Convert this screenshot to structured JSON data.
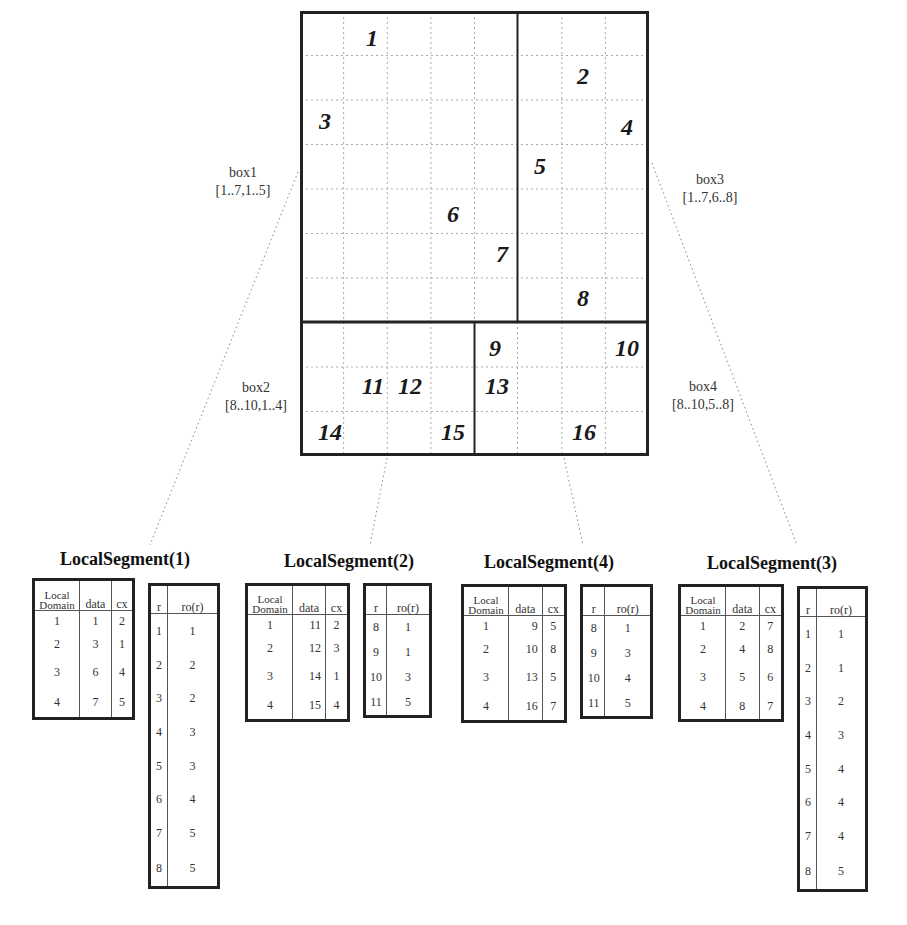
{
  "grid": {
    "rows": 10,
    "cols": 8,
    "cells": [
      {
        "label": "1",
        "row": 1,
        "col": 2
      },
      {
        "label": "2",
        "row": 2,
        "col": 7
      },
      {
        "label": "3",
        "row": 3,
        "col": 1
      },
      {
        "label": "4",
        "row": 3,
        "col": 8
      },
      {
        "label": "5",
        "row": 4,
        "col": 6
      },
      {
        "label": "6",
        "row": 5,
        "col": 4
      },
      {
        "label": "7",
        "row": 6,
        "col": 5
      },
      {
        "label": "8",
        "row": 7,
        "col": 7
      },
      {
        "label": "9",
        "row": 8,
        "col": 5
      },
      {
        "label": "10",
        "row": 8,
        "col": 8
      },
      {
        "label": "11",
        "row": 9,
        "col": 2
      },
      {
        "label": "12",
        "row": 9,
        "col": 3
      },
      {
        "label": "13",
        "row": 9,
        "col": 5
      },
      {
        "label": "14",
        "row": 10,
        "col": 1
      },
      {
        "label": "15",
        "row": 10,
        "col": 4
      },
      {
        "label": "16",
        "row": 10,
        "col": 7
      }
    ]
  },
  "boxes": [
    {
      "name": "box1",
      "range": "[1..7,1..5]"
    },
    {
      "name": "box2",
      "range": "[8..10,1..4]"
    },
    {
      "name": "box3",
      "range": "[1..7,6..8]"
    },
    {
      "name": "box4",
      "range": "[8..10,5..8]"
    }
  ],
  "segments": [
    {
      "title": "LocalSegment(1)",
      "domain_headers": {
        "local_domain_1": "Local",
        "local_domain_2": "Domain",
        "data": "data",
        "cx": "cx"
      },
      "domain_rows": [
        {
          "local": "1",
          "data": "1",
          "cx": "2"
        },
        {
          "local": "2",
          "data": "3",
          "cx": "1"
        },
        {
          "local": "3",
          "data": "6",
          "cx": "4"
        },
        {
          "local": "4",
          "data": "7",
          "cx": "5"
        }
      ],
      "ro_headers": {
        "r": "r",
        "ro": "ro(r)"
      },
      "ro_rows": [
        {
          "r": "1",
          "ro": "1"
        },
        {
          "r": "2",
          "ro": "2"
        },
        {
          "r": "3",
          "ro": "2"
        },
        {
          "r": "4",
          "ro": "3"
        },
        {
          "r": "5",
          "ro": "3"
        },
        {
          "r": "6",
          "ro": "4"
        },
        {
          "r": "7",
          "ro": "5"
        },
        {
          "r": "8",
          "ro": "5"
        }
      ]
    },
    {
      "title": "LocalSegment(2)",
      "domain_headers": {
        "local_domain_1": "Local",
        "local_domain_2": "Domain",
        "data": "data",
        "cx": "cx"
      },
      "domain_rows": [
        {
          "local": "1",
          "data": "11",
          "cx": "2"
        },
        {
          "local": "2",
          "data": "12",
          "cx": "3"
        },
        {
          "local": "3",
          "data": "14",
          "cx": "1"
        },
        {
          "local": "4",
          "data": "15",
          "cx": "4"
        }
      ],
      "ro_headers": {
        "r": "r",
        "ro": "ro(r)"
      },
      "ro_rows": [
        {
          "r": "8",
          "ro": "1"
        },
        {
          "r": "9",
          "ro": "1"
        },
        {
          "r": "10",
          "ro": "3"
        },
        {
          "r": "11",
          "ro": "5"
        }
      ]
    },
    {
      "title": "LocalSegment(4)",
      "domain_headers": {
        "local_domain_1": "Local",
        "local_domain_2": "Domain",
        "data": "data",
        "cx": "cx"
      },
      "domain_rows": [
        {
          "local": "1",
          "data": "9",
          "cx": "5"
        },
        {
          "local": "2",
          "data": "10",
          "cx": "8"
        },
        {
          "local": "3",
          "data": "13",
          "cx": "5"
        },
        {
          "local": "4",
          "data": "16",
          "cx": "7"
        }
      ],
      "ro_headers": {
        "r": "r",
        "ro": "ro(r)"
      },
      "ro_rows": [
        {
          "r": "8",
          "ro": "1"
        },
        {
          "r": "9",
          "ro": "3"
        },
        {
          "r": "10",
          "ro": "4"
        },
        {
          "r": "11",
          "ro": "5"
        }
      ]
    },
    {
      "title": "LocalSegment(3)",
      "domain_headers": {
        "local_domain_1": "Local",
        "local_domain_2": "Domain",
        "data": "data",
        "cx": "cx"
      },
      "domain_rows": [
        {
          "local": "1",
          "data": "2",
          "cx": "7"
        },
        {
          "local": "2",
          "data": "4",
          "cx": "8"
        },
        {
          "local": "3",
          "data": "5",
          "cx": "6"
        },
        {
          "local": "4",
          "data": "8",
          "cx": "7"
        }
      ],
      "ro_headers": {
        "r": "r",
        "ro": "ro(r)"
      },
      "ro_rows": [
        {
          "r": "1",
          "ro": "1"
        },
        {
          "r": "2",
          "ro": "1"
        },
        {
          "r": "3",
          "ro": "2"
        },
        {
          "r": "4",
          "ro": "3"
        },
        {
          "r": "5",
          "ro": "4"
        },
        {
          "r": "6",
          "ro": "4"
        },
        {
          "r": "7",
          "ro": "4"
        },
        {
          "r": "8",
          "ro": "5"
        }
      ]
    }
  ]
}
